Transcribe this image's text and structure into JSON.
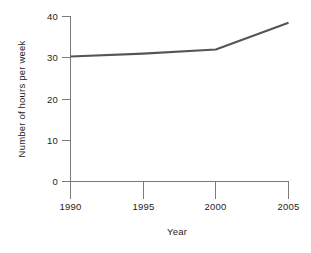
{
  "chart_data": {
    "type": "line",
    "title": "",
    "xlabel": "Year",
    "ylabel": "Number of hours per week",
    "x": [
      1990,
      1995,
      2000,
      2005
    ],
    "values": [
      30.3,
      31.0,
      32.0,
      38.5
    ],
    "series": [
      {
        "name": "Number of hours per week",
        "values": [
          30.3,
          31.0,
          32.0,
          38.5
        ]
      }
    ],
    "xlim": [
      1990,
      2005
    ],
    "ylim": [
      0,
      40
    ],
    "xticks": [
      1990,
      1995,
      2000,
      2005
    ],
    "xtick_labels": [
      "1990",
      "1995",
      "2000",
      "2005"
    ],
    "yticks": [
      0,
      10,
      20,
      30,
      40
    ],
    "ytick_labels": [
      "0",
      "10",
      "20",
      "30",
      "40"
    ],
    "grid": false,
    "legend": null,
    "legend_position": "none",
    "line_color": "#555555",
    "axis_color": "#7a7a7a",
    "text_color": "#1d1d1d",
    "background_color": "#ffffff"
  },
  "axes": {
    "y_tick_0": "0",
    "y_tick_1": "10",
    "y_tick_2": "20",
    "y_tick_3": "30",
    "y_tick_4": "40",
    "x_tick_0": "1990",
    "x_tick_1": "1995",
    "x_tick_2": "2000",
    "x_tick_3": "2005",
    "x_title": "Year",
    "y_title": "Number of hours per week"
  }
}
